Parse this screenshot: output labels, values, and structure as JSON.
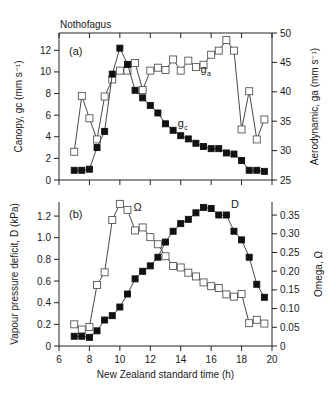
{
  "figure": {
    "title": "Nothofagus"
  },
  "chart_data": [
    {
      "type": "line",
      "panel_label": "(a)",
      "title": "Nothofagus",
      "xlabel": "",
      "ylabel": "Canopy, g_c (mm s^-1)",
      "ylabel_right": "Aerodynamic, g_a (mm s^-1)",
      "xlim": [
        6,
        20
      ],
      "ylim": [
        0,
        13.6
      ],
      "ylim_right": [
        25,
        50
      ],
      "x_ticks": [
        6,
        8,
        10,
        12,
        14,
        16,
        18,
        20
      ],
      "y_ticks": [
        0,
        2,
        4,
        6,
        8,
        10,
        12
      ],
      "y_ticks_right": [
        25,
        30,
        35,
        40,
        45,
        50
      ],
      "grid": false,
      "x": [
        7,
        7.5,
        8,
        8.5,
        9,
        9.5,
        10,
        10.5,
        11,
        11.5,
        12,
        12.5,
        13,
        13.5,
        14,
        14.5,
        15,
        15.5,
        16,
        16.5,
        17,
        17.5,
        18,
        18.5,
        19,
        19.5
      ],
      "series": [
        {
          "name": "g_c",
          "label": "g",
          "sub": "c",
          "axis": "left",
          "marker": "filled-square",
          "values": [
            0.9,
            0.9,
            1.0,
            3.0,
            4.5,
            9.8,
            12.2,
            10.7,
            8.3,
            7.6,
            6.9,
            6.2,
            5.2,
            4.6,
            4.1,
            3.8,
            3.4,
            3.1,
            2.9,
            2.9,
            2.5,
            2.4,
            1.8,
            0.9,
            0.9,
            0.8
          ],
          "label_pos": {
            "x": 13.8,
            "y": 4.9
          }
        },
        {
          "name": "g_a",
          "label": "g",
          "sub": "a",
          "axis": "right",
          "marker": "open-square",
          "values": [
            29.8,
            39.3,
            35.5,
            31.9,
            39.2,
            42.1,
            43.6,
            43.6,
            44.9,
            40.3,
            43.6,
            44.1,
            43.7,
            45.5,
            43.6,
            45.3,
            44.2,
            44.6,
            46.3,
            47.0,
            48.8,
            47.0,
            33.6,
            40.1,
            31.9,
            35.3
          ],
          "label_pos": {
            "x": 15.3,
            "y": 43.2
          }
        }
      ]
    },
    {
      "type": "line",
      "panel_label": "(b)",
      "xlabel": "New Zealand standard time (h)",
      "ylabel": "Vapour pressure deficit, D (kPa)",
      "ylabel_right": "Omega, Ω",
      "xlim": [
        6,
        20
      ],
      "ylim": [
        0,
        1.33
      ],
      "ylim_right": [
        0,
        0.385
      ],
      "x_ticks": [
        6,
        8,
        10,
        12,
        14,
        16,
        18,
        20
      ],
      "y_ticks": [
        0,
        0.2,
        0.4,
        0.6,
        0.8,
        1.0,
        1.2
      ],
      "y_tick_labels": [
        "0",
        "0.2",
        "0.4",
        "0.6",
        "0.8",
        "1.0",
        "1.2"
      ],
      "y_ticks_right": [
        0,
        0.05,
        0.1,
        0.15,
        0.2,
        0.25,
        0.3,
        0.35
      ],
      "y_tick_labels_right": [
        "0",
        "0.05",
        "0.10",
        "0.15",
        "0.20",
        "0.25",
        "0.30",
        "0.35"
      ],
      "grid": false,
      "x": [
        7,
        7.5,
        8,
        8.5,
        9,
        9.5,
        10,
        10.5,
        11,
        11.5,
        12,
        12.5,
        13,
        13.5,
        14,
        14.5,
        15,
        15.5,
        16,
        16.5,
        17,
        17.5,
        18,
        18.5,
        19,
        19.5
      ],
      "series": [
        {
          "name": "D",
          "label": "D",
          "axis": "left",
          "marker": "filled-square",
          "values": [
            0.09,
            0.09,
            0.08,
            0.14,
            0.24,
            0.28,
            0.36,
            0.48,
            0.62,
            0.69,
            0.74,
            0.82,
            0.96,
            1.06,
            1.13,
            1.17,
            1.23,
            1.28,
            1.27,
            1.21,
            1.21,
            1.06,
            0.98,
            0.82,
            0.57,
            0.45
          ],
          "label_pos": {
            "x": 17.3,
            "y": 1.27
          }
        },
        {
          "name": "Omega",
          "label": "Ω",
          "axis": "right",
          "marker": "open-square",
          "values": [
            0.058,
            0.044,
            0.051,
            0.163,
            0.197,
            0.337,
            0.38,
            0.364,
            0.309,
            0.317,
            0.291,
            0.272,
            0.24,
            0.214,
            0.21,
            0.196,
            0.186,
            0.17,
            0.16,
            0.155,
            0.138,
            0.132,
            0.139,
            0.061,
            0.07,
            0.06
          ],
          "label_pos": {
            "x": 10.9,
            "y": 0.36
          }
        }
      ]
    }
  ]
}
